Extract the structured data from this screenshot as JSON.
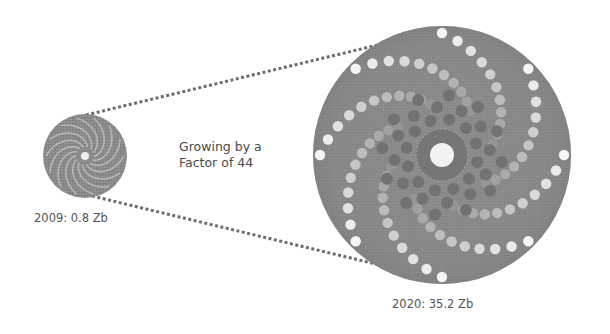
{
  "diagram": {
    "small_disc": {
      "year": "2009",
      "value": "0.8",
      "unit": "Zb",
      "label": "2009: 0.8 Zb"
    },
    "large_disc": {
      "year": "2020",
      "value": "35.2",
      "unit": "Zb",
      "label": "2020: 35.2 Zb"
    },
    "annotation": {
      "line1": "Growing by a",
      "line2": "Factor of 44"
    },
    "growth_factor": 44,
    "colors": {
      "disc_fill": "#8a8a8a",
      "disc_dark": "#6f6f6f",
      "dot_light": "#f2f2f2",
      "dot_mid": "#b5b5b5",
      "dot_dark": "#707070",
      "connector": "#6e6e6e",
      "text": "#555555",
      "background": "#ffffff"
    }
  }
}
